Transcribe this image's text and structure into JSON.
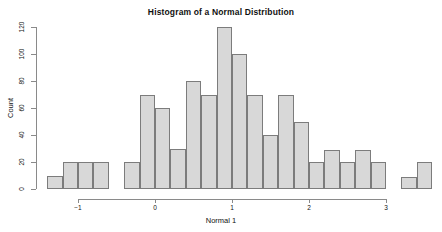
{
  "chart_data": {
    "type": "bar",
    "title": "Histogram of a Normal Distribution",
    "xlabel": "Normal 1",
    "ylabel": "Count",
    "xlim": [
      -1.4,
      3.6
    ],
    "ylim": [
      0,
      120
    ],
    "grid": false,
    "legend": null,
    "bin_width": 0.2,
    "x_ticks": [
      {
        "value": -1,
        "label": "−1"
      },
      {
        "value": 0,
        "label": "0"
      },
      {
        "value": 1,
        "label": "1"
      },
      {
        "value": 2,
        "label": "2"
      },
      {
        "value": 3,
        "label": "3"
      }
    ],
    "y_ticks": [
      {
        "value": 0,
        "label": "0"
      },
      {
        "value": 20,
        "label": "20"
      },
      {
        "value": 40,
        "label": "40"
      },
      {
        "value": 60,
        "label": "60"
      },
      {
        "value": 80,
        "label": "80"
      },
      {
        "value": 100,
        "label": "100"
      },
      {
        "value": 120,
        "label": "120"
      }
    ],
    "bar_fill_color": "#d8d8d8",
    "bar_border_color": "#7c7c7c",
    "bins": [
      {
        "x0": -1.4,
        "x1": -1.2,
        "count": 10
      },
      {
        "x0": -1.2,
        "x1": -1.0,
        "count": 20
      },
      {
        "x0": -1.0,
        "x1": -0.8,
        "count": 20
      },
      {
        "x0": -0.8,
        "x1": -0.6,
        "count": 20
      },
      {
        "x0": -0.6,
        "x1": -0.4,
        "count": 0
      },
      {
        "x0": -0.4,
        "x1": -0.2,
        "count": 20
      },
      {
        "x0": -0.2,
        "x1": 0.0,
        "count": 70
      },
      {
        "x0": 0.0,
        "x1": 0.2,
        "count": 60
      },
      {
        "x0": 0.2,
        "x1": 0.4,
        "count": 30
      },
      {
        "x0": 0.4,
        "x1": 0.6,
        "count": 80
      },
      {
        "x0": 0.6,
        "x1": 0.8,
        "count": 70
      },
      {
        "x0": 0.8,
        "x1": 1.0,
        "count": 120
      },
      {
        "x0": 1.0,
        "x1": 1.2,
        "count": 100
      },
      {
        "x0": 1.2,
        "x1": 1.4,
        "count": 70
      },
      {
        "x0": 1.4,
        "x1": 1.6,
        "count": 40
      },
      {
        "x0": 1.6,
        "x1": 1.8,
        "count": 70
      },
      {
        "x0": 1.8,
        "x1": 2.0,
        "count": 50
      },
      {
        "x0": 2.0,
        "x1": 2.2,
        "count": 20
      },
      {
        "x0": 2.2,
        "x1": 2.4,
        "count": 29
      },
      {
        "x0": 2.4,
        "x1": 2.6,
        "count": 20
      },
      {
        "x0": 2.6,
        "x1": 2.8,
        "count": 29
      },
      {
        "x0": 2.8,
        "x1": 3.0,
        "count": 20
      },
      {
        "x0": 3.0,
        "x1": 3.2,
        "count": 0
      },
      {
        "x0": 3.2,
        "x1": 3.4,
        "count": 9
      },
      {
        "x0": 3.4,
        "x1": 3.6,
        "count": 20
      }
    ]
  }
}
